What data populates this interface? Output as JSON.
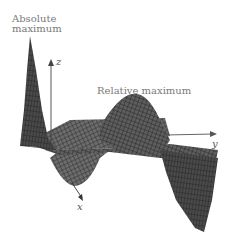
{
  "figure": {
    "annotations": {
      "absolute_max_line1": "Absolute",
      "absolute_max_line2": "maximum",
      "relative_max": "Relative maximum"
    },
    "axes": {
      "x": "x",
      "y": "y",
      "z": "z"
    },
    "colors": {
      "surface_dark": "#3a3a3a",
      "surface_mid": "#6a6a6a",
      "mesh_line": "#1e1e1e",
      "label_text": "#7a7a7a"
    }
  }
}
